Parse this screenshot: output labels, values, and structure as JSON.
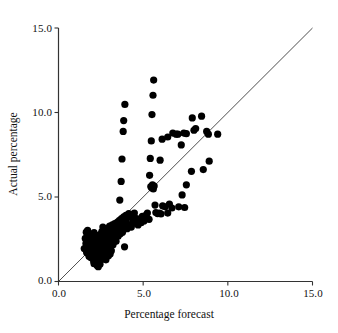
{
  "figure": {
    "title": "",
    "background": "#ffffff",
    "point_color": "#000000",
    "line_color": "#222222"
  },
  "axes": {
    "x": {
      "label": "Percentage forecast",
      "ticks": [
        "0.0",
        "5.0",
        "10.0",
        "15.0"
      ],
      "tick_values": [
        0,
        5,
        10,
        15
      ],
      "min": 0,
      "max": 15
    },
    "y": {
      "label": "Actual percentage",
      "ticks": [
        "0.0",
        "5.0",
        "10.0",
        "15.0"
      ],
      "tick_values": [
        0,
        5,
        10,
        15
      ],
      "min": 0,
      "max": 15
    }
  },
  "chart_data": {
    "type": "scatter",
    "title": "",
    "xlabel": "Percentage forecast",
    "ylabel": "Actual percentage",
    "xlim": [
      0,
      15
    ],
    "ylim": [
      0,
      15
    ],
    "xticks": [
      0,
      5,
      10,
      15
    ],
    "yticks": [
      0,
      5,
      10,
      15
    ],
    "xticklabels": [
      "0.0",
      "5.0",
      "10.0",
      "15.0"
    ],
    "yticklabels": [
      "0.0",
      "5.0",
      "10.0",
      "15.0"
    ],
    "grid": false,
    "legend": null,
    "reference_line": {
      "name": "identity-line",
      "type": "line",
      "equation": "y = x",
      "x": [
        0,
        15
      ],
      "y": [
        0,
        15
      ],
      "color": "#222222",
      "width": 0.8
    },
    "series": [
      {
        "name": "forecast-vs-actual",
        "marker": "filled-circle",
        "marker_size": 3.6,
        "color": "#000000",
        "points": [
          [
            1.52,
            1.95
          ],
          [
            1.58,
            2.55
          ],
          [
            1.62,
            2.25
          ],
          [
            1.66,
            1.72
          ],
          [
            1.7,
            2.42
          ],
          [
            1.74,
            2.05
          ],
          [
            1.78,
            2.78
          ],
          [
            1.8,
            1.5
          ],
          [
            1.82,
            2.3
          ],
          [
            1.86,
            1.88
          ],
          [
            1.88,
            2.62
          ],
          [
            1.9,
            2.18
          ],
          [
            1.92,
            1.4
          ],
          [
            1.95,
            2.48
          ],
          [
            1.98,
            2.02
          ],
          [
            2.0,
            2.7
          ],
          [
            2.02,
            1.62
          ],
          [
            2.05,
            2.22
          ],
          [
            2.08,
            1.18
          ],
          [
            2.1,
            2.9
          ],
          [
            2.12,
            2.38
          ],
          [
            2.14,
            1.78
          ],
          [
            2.16,
            2.08
          ],
          [
            2.18,
            2.52
          ],
          [
            2.2,
            1.32
          ],
          [
            2.22,
            2.62
          ],
          [
            2.24,
            1.98
          ],
          [
            2.26,
            2.28
          ],
          [
            2.28,
            0.95
          ],
          [
            2.3,
            2.72
          ],
          [
            2.32,
            1.55
          ],
          [
            2.34,
            2.15
          ],
          [
            2.36,
            2.45
          ],
          [
            2.38,
            1.08
          ],
          [
            2.4,
            2.35
          ],
          [
            2.42,
            1.85
          ],
          [
            2.44,
            2.58
          ],
          [
            2.46,
            1.22
          ],
          [
            2.48,
            2.05
          ],
          [
            2.5,
            2.8
          ],
          [
            2.52,
            1.65
          ],
          [
            2.54,
            2.25
          ],
          [
            2.56,
            2.95
          ],
          [
            2.58,
            1.45
          ],
          [
            2.6,
            2.42
          ],
          [
            2.62,
            1.92
          ],
          [
            2.64,
            2.68
          ],
          [
            2.66,
            1.35
          ],
          [
            2.68,
            2.18
          ],
          [
            2.7,
            2.52
          ],
          [
            2.72,
            1.75
          ],
          [
            2.74,
            2.32
          ],
          [
            2.76,
            3.02
          ],
          [
            2.78,
            1.58
          ],
          [
            2.8,
            2.62
          ],
          [
            2.82,
            2.12
          ],
          [
            2.84,
            2.85
          ],
          [
            2.86,
            1.95
          ],
          [
            2.88,
            2.45
          ],
          [
            2.9,
            3.15
          ],
          [
            2.92,
            2.28
          ],
          [
            2.94,
            1.68
          ],
          [
            2.96,
            2.72
          ],
          [
            2.98,
            2.98
          ],
          [
            3.0,
            2.38
          ],
          [
            3.02,
            3.28
          ],
          [
            3.05,
            2.55
          ],
          [
            3.08,
            1.88
          ],
          [
            3.1,
            2.82
          ],
          [
            3.12,
            3.08
          ],
          [
            3.15,
            2.48
          ],
          [
            3.18,
            3.35
          ],
          [
            3.2,
            2.68
          ],
          [
            3.22,
            2.18
          ],
          [
            3.25,
            2.95
          ],
          [
            3.28,
            3.18
          ],
          [
            3.3,
            2.58
          ],
          [
            3.32,
            3.42
          ],
          [
            3.35,
            2.78
          ],
          [
            3.38,
            3.02
          ],
          [
            3.4,
            2.38
          ],
          [
            3.42,
            3.25
          ],
          [
            3.45,
            2.88
          ],
          [
            3.48,
            3.52
          ],
          [
            3.5,
            3.12
          ],
          [
            3.52,
            2.68
          ],
          [
            3.55,
            3.35
          ],
          [
            3.58,
            2.98
          ],
          [
            3.6,
            3.62
          ],
          [
            3.62,
            3.18
          ],
          [
            3.65,
            2.82
          ],
          [
            3.68,
            3.45
          ],
          [
            3.7,
            3.05
          ],
          [
            3.72,
            3.72
          ],
          [
            3.75,
            3.28
          ],
          [
            3.78,
            2.92
          ],
          [
            3.8,
            3.55
          ],
          [
            3.82,
            3.15
          ],
          [
            3.85,
            3.82
          ],
          [
            3.88,
            3.38
          ],
          [
            3.9,
            2.05
          ],
          [
            3.92,
            3.65
          ],
          [
            3.95,
            3.25
          ],
          [
            3.98,
            3.92
          ],
          [
            4.0,
            3.48
          ],
          [
            4.05,
            3.12
          ],
          [
            4.1,
            3.78
          ],
          [
            4.15,
            4.02
          ],
          [
            4.2,
            3.35
          ],
          [
            4.25,
            3.88
          ],
          [
            4.3,
            3.22
          ],
          [
            4.35,
            3.95
          ],
          [
            4.4,
            3.58
          ],
          [
            4.48,
            4.05
          ],
          [
            4.55,
            3.45
          ],
          [
            4.62,
            3.72
          ],
          [
            4.7,
            3.35
          ],
          [
            4.8,
            3.62
          ],
          [
            4.88,
            3.48
          ],
          [
            4.95,
            3.85
          ],
          [
            5.05,
            3.58
          ],
          [
            5.15,
            3.92
          ],
          [
            5.25,
            4.05
          ],
          [
            5.35,
            3.68
          ],
          [
            5.45,
            5.62
          ],
          [
            5.5,
            5.55
          ],
          [
            5.55,
            5.72
          ],
          [
            5.6,
            5.48
          ],
          [
            5.65,
            5.65
          ],
          [
            5.7,
            4.52
          ],
          [
            5.75,
            4.08
          ],
          [
            5.85,
            4.02
          ],
          [
            5.95,
            4.05
          ],
          [
            6.05,
            4.0
          ],
          [
            6.15,
            4.48
          ],
          [
            6.3,
            4.42
          ],
          [
            6.45,
            4.05
          ],
          [
            6.55,
            4.58
          ],
          [
            6.7,
            4.35
          ],
          [
            7.1,
            4.42
          ],
          [
            7.3,
            5.12
          ],
          [
            7.45,
            4.38
          ],
          [
            7.55,
            5.72
          ],
          [
            7.85,
            6.52
          ],
          [
            8.55,
            6.62
          ],
          [
            8.9,
            7.12
          ],
          [
            3.62,
            4.82
          ],
          [
            3.7,
            5.92
          ],
          [
            3.75,
            7.25
          ],
          [
            3.82,
            8.88
          ],
          [
            3.85,
            9.52
          ],
          [
            3.92,
            10.48
          ],
          [
            5.38,
            6.28
          ],
          [
            5.42,
            7.28
          ],
          [
            5.48,
            8.32
          ],
          [
            5.52,
            9.88
          ],
          [
            5.58,
            11.02
          ],
          [
            5.62,
            11.92
          ],
          [
            6.0,
            7.18
          ],
          [
            6.12,
            8.42
          ],
          [
            6.45,
            8.55
          ],
          [
            6.75,
            8.78
          ],
          [
            6.95,
            8.72
          ],
          [
            7.05,
            8.72
          ],
          [
            7.25,
            8.08
          ],
          [
            7.4,
            8.78
          ],
          [
            7.55,
            8.75
          ],
          [
            7.9,
            9.68
          ],
          [
            8.0,
            8.95
          ],
          [
            8.1,
            9.05
          ],
          [
            8.45,
            9.78
          ],
          [
            8.75,
            8.88
          ],
          [
            8.85,
            8.72
          ],
          [
            9.4,
            8.72
          ],
          [
            2.95,
            1.52
          ],
          [
            3.05,
            1.62
          ],
          [
            2.1,
            1.05
          ],
          [
            2.35,
            0.88
          ],
          [
            2.45,
            1.02
          ],
          [
            1.64,
            2.92
          ],
          [
            1.72,
            3.02
          ],
          [
            2.62,
            3.22
          ],
          [
            2.8,
            1.28
          ],
          [
            3.12,
            1.82
          ]
        ]
      }
    ]
  },
  "icons": {
    "none": ""
  }
}
